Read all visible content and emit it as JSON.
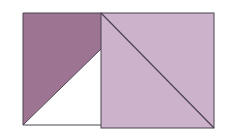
{
  "diagram": {
    "colors": {
      "dark_shade": "#9e7493",
      "light_shade": "#cdb2cc",
      "outline": "#4a4250",
      "background": "#ffffff"
    },
    "left_square": {
      "x": 23,
      "y": 13,
      "w": 78,
      "h": 112
    },
    "right_square": {
      "x": 101,
      "y": 13,
      "w": 113,
      "h": 115
    }
  }
}
